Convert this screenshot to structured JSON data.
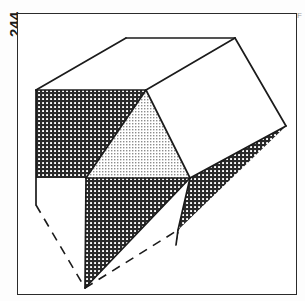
{
  "page": {
    "page_number": "244",
    "margin_note": "F",
    "background_color": "#fdfdfd"
  },
  "figure": {
    "name": "hatched-polyhedron-diagram",
    "frame": {
      "x": 17,
      "y": 13,
      "width": 280,
      "height": 282,
      "stroke": "#2b2b2b",
      "stroke_width": 1.5,
      "fill": "#ffffff"
    },
    "style": {
      "outline_color": "#1b1b1b",
      "outline_width": 1.6,
      "dash_pattern": "9 7",
      "dark_hatch_color": "#2a2a2a",
      "dark_hatch_background": "#ffffff",
      "light_stipple_color": "#8d8d8d",
      "light_stipple_background": "#ffffff",
      "white_face_color": "#ffffff"
    },
    "vertices": {
      "top_left_ridge": [
        126,
        38
      ],
      "top_right_ridge": [
        235,
        38
      ],
      "left_upper": [
        36,
        90
      ],
      "mid_upper": [
        146,
        90
      ],
      "right_far": [
        286,
        126
      ],
      "mid_right": [
        190,
        178
      ],
      "mid_center": [
        86,
        178
      ],
      "left_lower": [
        36,
        205
      ],
      "bottom_apex": [
        85,
        288
      ],
      "mid_lower_right": [
        176,
        245
      ],
      "right_lower": [
        178,
        230
      ]
    },
    "faces": [
      {
        "name": "top-face-white",
        "fill": "white",
        "points": "126,38 235,38 146,90 36,90"
      },
      {
        "name": "right-face-white",
        "fill": "white",
        "points": "235,38 286,126 190,178 146,90"
      },
      {
        "name": "left-face-dark-hatch",
        "fill": "dark-hatch",
        "points": "36,90 146,90 86,178 36,178"
      },
      {
        "name": "center-face-light-stipple",
        "fill": "light-stipple",
        "points": "146,90 190,178 86,178"
      },
      {
        "name": "lower-left-white-wedge",
        "fill": "white",
        "points": "36,178 86,178 36,205"
      },
      {
        "name": "lower-center-dark-hatch",
        "fill": "dark-hatch",
        "points": "86,178 190,178 85,288"
      },
      {
        "name": "lower-right-dark-hatch",
        "fill": "dark-hatch",
        "points": "190,178 286,126 178,230"
      },
      {
        "name": "far-right-dark-sliver",
        "fill": "dark-hatch",
        "points": "190,178 178,230 176,245"
      }
    ],
    "solid_edges": [
      {
        "name": "edge-top-ridge",
        "from": [
          126,
          38
        ],
        "to": [
          235,
          38
        ]
      },
      {
        "name": "edge-top-left",
        "from": [
          126,
          38
        ],
        "to": [
          36,
          90
        ]
      },
      {
        "name": "edge-top-inner",
        "from": [
          36,
          90
        ],
        "to": [
          146,
          90
        ]
      },
      {
        "name": "edge-ridge-to-mid",
        "from": [
          235,
          38
        ],
        "to": [
          146,
          90
        ]
      },
      {
        "name": "edge-ridge-to-right",
        "from": [
          235,
          38
        ],
        "to": [
          286,
          126
        ]
      },
      {
        "name": "edge-right-down",
        "from": [
          286,
          126
        ],
        "to": [
          190,
          178
        ]
      },
      {
        "name": "edge-mid-diagonal",
        "from": [
          146,
          90
        ],
        "to": [
          190,
          178
        ]
      },
      {
        "name": "edge-left-diagonal",
        "from": [
          146,
          90
        ],
        "to": [
          86,
          178
        ]
      },
      {
        "name": "edge-left-vertical",
        "from": [
          36,
          90
        ],
        "to": [
          36,
          205
        ]
      },
      {
        "name": "edge-mid-horizontal",
        "from": [
          86,
          178
        ],
        "to": [
          190,
          178
        ]
      },
      {
        "name": "edge-center-vertical",
        "from": [
          86,
          178
        ],
        "to": [
          85,
          288
        ]
      },
      {
        "name": "edge-apex-to-right",
        "from": [
          85,
          288
        ],
        "to": [
          190,
          178
        ]
      },
      {
        "name": "edge-right-lower",
        "from": [
          190,
          178
        ],
        "to": [
          178,
          230
        ]
      },
      {
        "name": "edge-right-lower-tail",
        "from": [
          178,
          230
        ],
        "to": [
          176,
          245
        ]
      }
    ],
    "dashed_edges": [
      {
        "name": "hidden-edge-left",
        "from": [
          36,
          205
        ],
        "to": [
          85,
          288
        ]
      },
      {
        "name": "hidden-edge-bottom-right",
        "from": [
          85,
          288
        ],
        "to": [
          178,
          230
        ]
      }
    ]
  }
}
